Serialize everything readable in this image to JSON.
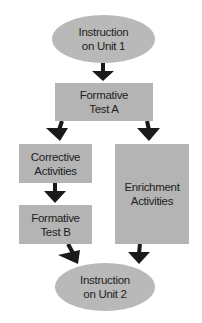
{
  "diagram": {
    "nodes": {
      "start": {
        "label": "Instruction\non Unit 1",
        "shape": "ellipse"
      },
      "test_a": {
        "label": "Formative\nTest A",
        "shape": "box"
      },
      "corrective": {
        "label": "Corrective\nActivities",
        "shape": "box"
      },
      "enrichment": {
        "label": "Enrichment\nActivities",
        "shape": "box"
      },
      "test_b": {
        "label": "Formative\nTest B",
        "shape": "box"
      },
      "end": {
        "label": "Instruction\non Unit 2",
        "shape": "ellipse"
      }
    },
    "edges": [
      {
        "from": "Instruction on Unit 1",
        "to": "Formative Test A"
      },
      {
        "from": "Formative Test A",
        "to": "Corrective Activities"
      },
      {
        "from": "Formative Test A",
        "to": "Enrichment Activities"
      },
      {
        "from": "Corrective Activities",
        "to": "Formative Test B"
      },
      {
        "from": "Formative Test B",
        "to": "Instruction on Unit 2"
      },
      {
        "from": "Enrichment Activities",
        "to": "Instruction on Unit 2"
      }
    ],
    "colors": {
      "shape_fill": "#b4b4b4",
      "arrow": "#1a1a1a",
      "text": "#1e1e1e"
    }
  }
}
